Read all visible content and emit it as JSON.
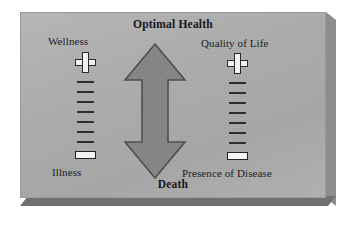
{
  "diagram": {
    "type": "health-continuum",
    "title_top": "Optimal Health",
    "title_bottom": "Death",
    "center_arrow": {
      "icon": "double-headed-vertical-arrow",
      "direction": "up-down",
      "fill_color": "#808080",
      "stroke_color": "#4a4a4a"
    },
    "panel": {
      "background_color": "#acacac",
      "shadow_color": "#707070"
    },
    "scales": [
      {
        "id": "left",
        "top_label": "Wellness",
        "bottom_label": "Illness",
        "top_symbol": "plus-sign",
        "bottom_symbol": "minus-box",
        "tick_count": 7
      },
      {
        "id": "right",
        "top_label": "Quality of Life",
        "bottom_label": "Presence of Disease",
        "top_symbol": "plus-sign",
        "bottom_symbol": "minus-box",
        "tick_count": 7
      }
    ]
  }
}
